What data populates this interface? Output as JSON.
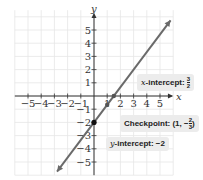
{
  "chart_data": {
    "type": "line",
    "title": "",
    "xlabel": "x",
    "ylabel": "y",
    "xlim": [
      -6,
      6
    ],
    "ylim": [
      -6,
      6.5
    ],
    "grid": true,
    "x_ticks": [
      -5,
      -4,
      -3,
      -2,
      -1,
      1,
      2,
      3,
      4,
      5
    ],
    "y_ticks": [
      5,
      4,
      3,
      2,
      1,
      -1,
      -2,
      -3,
      -4,
      -5
    ],
    "series": [
      {
        "name": "line",
        "equation": "y = (4/3)x - 2",
        "slope": 1.3333,
        "intercept": -2,
        "x": [
          -2.8,
          5.8
        ],
        "y": [
          -5.73,
          5.73
        ],
        "color": "#6a6a6a"
      }
    ],
    "points": [
      {
        "label": "x-intercept",
        "x": 1.5,
        "y": 0
      },
      {
        "label": "Checkpoint",
        "x": 1,
        "y": -0.6667
      },
      {
        "label": "y-intercept",
        "x": 0,
        "y": -2
      }
    ],
    "annotations": [
      {
        "id": "x_intercept",
        "prefix": "x",
        "text": "-intercept: ",
        "num": "3",
        "den": "2"
      },
      {
        "id": "checkpoint",
        "text": "Checkpoint: (1, −",
        "num": "2",
        "den": "3",
        "suffix": ")"
      },
      {
        "id": "y_intercept",
        "prefix": "y",
        "text": "-intercept: −2"
      }
    ]
  },
  "labels": {
    "x_axis": "x",
    "y_axis": "y",
    "x_ticks": [
      "−5",
      "−4",
      "−3",
      "−2",
      "−1",
      "1",
      "2",
      "3",
      "4",
      "5"
    ],
    "y_ticks": [
      "5",
      "4",
      "3",
      "2",
      "1",
      "−1",
      "−2",
      "−3",
      "−4",
      "−5"
    ],
    "x_intercept_prefix": "x",
    "x_intercept_text": "-intercept: ",
    "x_intercept_num": "3",
    "x_intercept_den": "2",
    "checkpoint_text": "Checkpoint: (1, −",
    "checkpoint_num": "2",
    "checkpoint_den": "3",
    "checkpoint_suffix": ")",
    "y_intercept_prefix": "y",
    "y_intercept_text": "-intercept: −2"
  }
}
